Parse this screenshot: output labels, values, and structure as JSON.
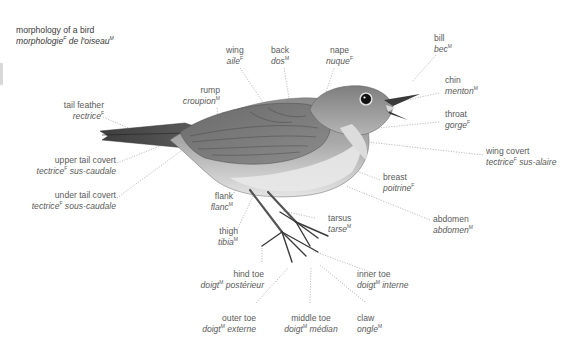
{
  "title": {
    "en": "morphology of a bird",
    "fr": "morphologie",
    "fr_gender": "F",
    "fr_rest": " de l'oiseau",
    "fr_rest_gender": "M"
  },
  "labels": [
    {
      "id": "wing",
      "en": "wing",
      "fr": "aile",
      "gender": "F"
    },
    {
      "id": "back",
      "en": "back",
      "fr": "dos",
      "gender": "M"
    },
    {
      "id": "nape",
      "en": "nape",
      "fr": "nuque",
      "gender": "F"
    },
    {
      "id": "bill",
      "en": "bill",
      "fr": "bec",
      "gender": "M"
    },
    {
      "id": "rump",
      "en": "rump",
      "fr": "croupion",
      "gender": "M"
    },
    {
      "id": "chin",
      "en": "chin",
      "fr": "menton",
      "gender": "M"
    },
    {
      "id": "tail-feather",
      "en": "tail feather",
      "fr": "rectrice",
      "gender": "F"
    },
    {
      "id": "throat",
      "en": "throat",
      "fr": "gorge",
      "gender": "F"
    },
    {
      "id": "wing-covert",
      "en": "wing covert",
      "fr": "tectrice",
      "gender": "F",
      "fr_rest": " sus-alaire"
    },
    {
      "id": "upper-tail-covert",
      "en": "upper tail covert",
      "fr": "tectrice",
      "gender": "F",
      "fr_rest": " sus-caudale"
    },
    {
      "id": "under-tail-covert",
      "en": "under tail covert",
      "fr": "tectrice",
      "gender": "F",
      "fr_rest": " sous-caudale"
    },
    {
      "id": "breast",
      "en": "breast",
      "fr": "poitrine",
      "gender": "F"
    },
    {
      "id": "flank",
      "en": "flank",
      "fr": "flanc",
      "gender": "M"
    },
    {
      "id": "abdomen",
      "en": "abdomen",
      "fr": "abdomen",
      "gender": "M"
    },
    {
      "id": "tarsus",
      "en": "tarsus",
      "fr": "tarse",
      "gender": "M"
    },
    {
      "id": "thigh",
      "en": "thigh",
      "fr": "tibia",
      "gender": "M"
    },
    {
      "id": "hind-toe",
      "en": "hind toe",
      "fr": "doigt",
      "gender": "M",
      "fr_rest": " postérieur"
    },
    {
      "id": "inner-toe",
      "en": "inner toe",
      "fr": "doigt",
      "gender": "M",
      "fr_rest": " interne"
    },
    {
      "id": "outer-toe",
      "en": "outer toe",
      "fr": "doigt",
      "gender": "M",
      "fr_rest": " externe"
    },
    {
      "id": "middle-toe",
      "en": "middle toe",
      "fr": "doigt",
      "gender": "M",
      "fr_rest": " médian"
    },
    {
      "id": "claw",
      "en": "claw",
      "fr": "ongle",
      "gender": "M"
    }
  ],
  "colors": {
    "leader_line": "#9a9a9a",
    "label_text": "#5a5a5a",
    "bird_dark": "#4a4a4a",
    "bird_mid": "#7d7d7d",
    "bird_light": "#cfcfcf",
    "bird_belly": "#e6e6e6"
  }
}
